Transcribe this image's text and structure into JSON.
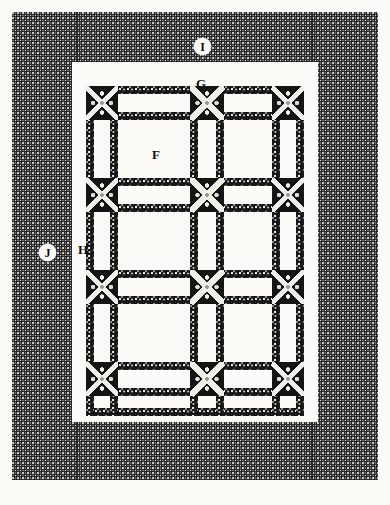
{
  "plate": {
    "kind": "architectural-ornament-plate",
    "caption": "",
    "background_color": "#fbfaf7",
    "ink_color": "#1b1b1b",
    "field_color": "#2f2f2f",
    "panel_color": "#fbfaf6"
  },
  "labels": [
    {
      "id": "F",
      "text": "F",
      "style": "plain",
      "note": "central coffer panel",
      "x": 152,
      "y": 148
    },
    {
      "id": "G",
      "text": "G",
      "style": "plain",
      "note": "upper white margin band",
      "x": 196,
      "y": 77
    },
    {
      "id": "H",
      "text": "H",
      "style": "plain",
      "note": "left white margin band",
      "x": 78,
      "y": 243
    },
    {
      "id": "I",
      "text": "I",
      "style": "circle",
      "note": "upper damask field",
      "x": 194,
      "y": 38
    },
    {
      "id": "J",
      "text": "J",
      "style": "circle",
      "note": "left damask field",
      "x": 39,
      "y": 244
    }
  ],
  "frame": {
    "outer": {
      "x": 12,
      "y": 12,
      "w": 366,
      "h": 468
    },
    "inner_white": {
      "x": 72,
      "y": 62,
      "w": 246,
      "h": 360
    },
    "grid": {
      "x": 86,
      "y": 86,
      "w": 218,
      "h": 330
    },
    "columns": 2,
    "rows": 3,
    "divider_left_x": 78,
    "divider_right_x": 312
  },
  "grid_data": {
    "type": "coffered-panel-plan",
    "col_edges": [
      86,
      118,
      198,
      230,
      304
    ],
    "row_edges": [
      86,
      112,
      130,
      186,
      204,
      222,
      278,
      296,
      314,
      370,
      388,
      416
    ],
    "rail_thickness": 8,
    "cross_block": 26
  }
}
